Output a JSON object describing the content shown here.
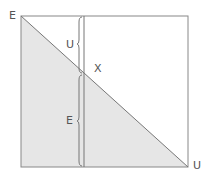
{
  "diagram": {
    "corner_labels": {
      "top_left": "E",
      "bottom_right": "U"
    },
    "intersection_label": "X",
    "upper_segment_label": "U",
    "lower_segment_label": "E",
    "colors": {
      "fill": "#e6e6e6",
      "stroke": "#777777"
    }
  }
}
